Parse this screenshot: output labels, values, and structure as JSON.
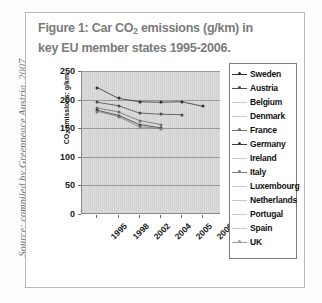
{
  "figure": {
    "title_line1": "Figure 1: Car CO",
    "title_sub": "2",
    "title_line1b": " emissions (g/km) in key EU",
    "title_line2": "member states 1995-2006.",
    "source_caption": "Source: compiled by Greenpeace Austria, 2007"
  },
  "chart_data": {
    "type": "line",
    "title": "Figure 1: Car CO2 emissions (g/km) in key EU member states 1995-2006.",
    "xlabel": "",
    "ylabel": "CO2 emissions: g/km",
    "ylabel_prefix": "CO",
    "ylabel_sub": "2",
    "ylabel_suffix": " emissions: g/km",
    "categories": [
      "1995",
      "1998",
      "2002",
      "2004",
      "2005",
      "2006"
    ],
    "yticks": [
      0,
      50,
      100,
      150,
      200,
      250
    ],
    "ylim": [
      0,
      250
    ],
    "grid": true,
    "legend_position": "right",
    "series": [
      {
        "name": "Sweden",
        "color": "#2f2f2f",
        "has_line": true,
        "values": [
          221,
          202,
          196,
          195,
          196,
          188
        ]
      },
      {
        "name": "Austria",
        "color": "#4a4a4a",
        "has_line": true,
        "values": [
          195,
          189,
          176,
          174,
          173,
          null
        ]
      },
      {
        "name": "Belgium",
        "color": "#8f8f8f",
        "has_line": false,
        "values": [
          null,
          null,
          null,
          null,
          null,
          null
        ]
      },
      {
        "name": "Denmark",
        "color": "#9a9a9a",
        "has_line": false,
        "values": [
          null,
          null,
          null,
          null,
          null,
          null
        ]
      },
      {
        "name": "France",
        "color": "#6d6d6d",
        "has_line": true,
        "values": [
          185,
          178,
          163,
          156,
          null,
          null
        ]
      },
      {
        "name": "Germany",
        "color": "#3a3a3a",
        "has_line": true,
        "values": [
          181,
          172,
          156,
          150,
          null,
          null
        ]
      },
      {
        "name": "Ireland",
        "color": "#a5a5a5",
        "has_line": false,
        "values": [
          null,
          null,
          null,
          null,
          null,
          null
        ]
      },
      {
        "name": "Italy",
        "color": "#7c7c7c",
        "has_line": true,
        "values": [
          179,
          170,
          152,
          149,
          null,
          null
        ]
      },
      {
        "name": "Luxembourg",
        "color": "#b0b0b0",
        "has_line": false,
        "values": [
          null,
          null,
          null,
          null,
          null,
          null
        ]
      },
      {
        "name": "Netherlands",
        "color": "#b5b5b5",
        "has_line": false,
        "values": [
          null,
          null,
          null,
          null,
          null,
          null
        ]
      },
      {
        "name": "Portugal",
        "color": "#bdbdbd",
        "has_line": false,
        "values": [
          null,
          null,
          null,
          null,
          null,
          null
        ]
      },
      {
        "name": "Spain",
        "color": "#c2c2c2",
        "has_line": false,
        "values": [
          null,
          null,
          null,
          null,
          null,
          null
        ]
      },
      {
        "name": "UK",
        "color": "#9e9e9e",
        "has_line": true,
        "values": [
          null,
          null,
          null,
          null,
          null,
          null
        ]
      }
    ]
  }
}
